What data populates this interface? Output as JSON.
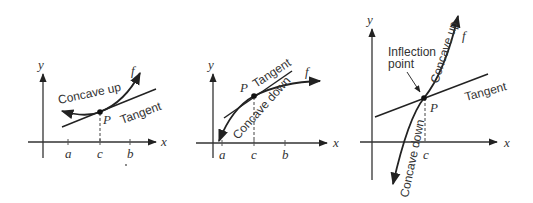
{
  "panels": [
    {
      "id": "concave-up",
      "axis_labels": {
        "x": "x",
        "y": "y"
      },
      "ticks": [
        "a",
        "c",
        "b"
      ],
      "curve_label": "Concave up",
      "function_label": "f",
      "point_label": "P",
      "tangent_label": "Tangent"
    },
    {
      "id": "concave-down",
      "axis_labels": {
        "x": "x",
        "y": "y"
      },
      "ticks": [
        "a",
        "c",
        "b"
      ],
      "curve_label": "Concave down",
      "function_label": "f",
      "point_label": "P",
      "tangent_label": "Tangent"
    },
    {
      "id": "inflection",
      "axis_labels": {
        "x": "x",
        "y": "y"
      },
      "ticks": [
        "c"
      ],
      "curve_label_upper": "Concave up",
      "curve_label_lower": "Concave down",
      "function_label": "f",
      "point_label": "P",
      "tangent_label": "Tangent",
      "annotation_line1": "Inflection",
      "annotation_line2": "point"
    }
  ],
  "colors": {
    "ink": "#222222",
    "background": "#ffffff"
  }
}
